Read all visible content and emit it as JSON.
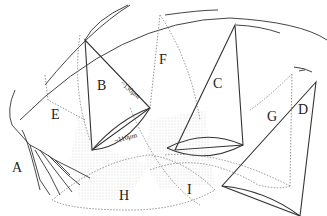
{
  "diagram": {
    "labels": {
      "A": "A",
      "B": "B",
      "C": "C",
      "D": "D",
      "E": "E",
      "F": "F",
      "G": "G",
      "H": "H",
      "I": "I"
    },
    "measurements": {
      "cone_height": "~130μm",
      "cone_base": "~110μm"
    },
    "colors": {
      "line": "#333333",
      "dotted": "#777777",
      "stipple": "#888888",
      "background": "#ffffff"
    }
  }
}
